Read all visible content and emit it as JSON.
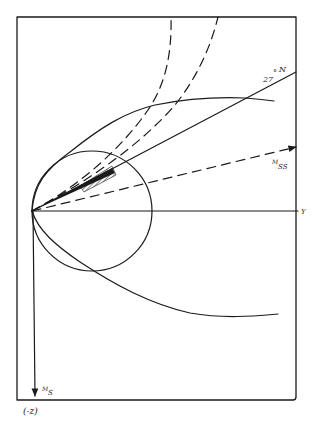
{
  "diagram": {
    "colors": {
      "ink": "#1a1a1a",
      "background": "#ffffff"
    },
    "labels": {
      "latitude_line": "27°N",
      "latitude_deg": "27",
      "latitude_deg_sym": "°",
      "latitude_N": "N",
      "mss_main": "M",
      "mss_sub": "SS",
      "y_axis": "Y",
      "ms_main": "M",
      "ms_sub": "S",
      "neg_z": "(-z)"
    },
    "elements": {
      "frame": "rectangular border",
      "horizontal_axis": "Y axis",
      "vertical_axis": "M_S axis pointing down (-z)",
      "circle": "circle tangent at origin",
      "line_27N": "solid line from origin labeled 27°N",
      "mss_vector": "dashed arrow from origin labeled M_SS",
      "dashed_curves": 2,
      "upper_envelope": "solid curve above",
      "lower_envelope": "solid curve below",
      "hatched_region": "shaded wedge near origin along 27°N line"
    }
  }
}
